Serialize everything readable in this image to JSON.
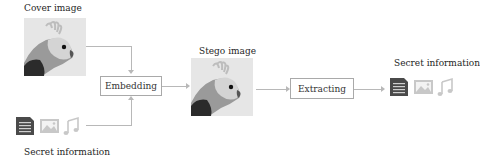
{
  "cover": {
    "label": "Cover image",
    "image": "cockatiel-grayscale"
  },
  "secret_left": {
    "label": "Secret information",
    "icons": [
      "document-icon",
      "image-icon",
      "music-note-icon"
    ]
  },
  "embed": {
    "label": "Embedding"
  },
  "stego": {
    "label": "Stego image",
    "image": "cockatiel-grayscale"
  },
  "extract": {
    "label": "Extracting"
  },
  "secret_right": {
    "label": "Secret information",
    "icons": [
      "document-icon",
      "image-icon",
      "music-note-icon"
    ]
  },
  "colors": {
    "line": "#b8b8b8",
    "box_border": "#a9a9a9",
    "doc_icon": "#4a4a4a",
    "light_icon": "#c8c8c8"
  }
}
